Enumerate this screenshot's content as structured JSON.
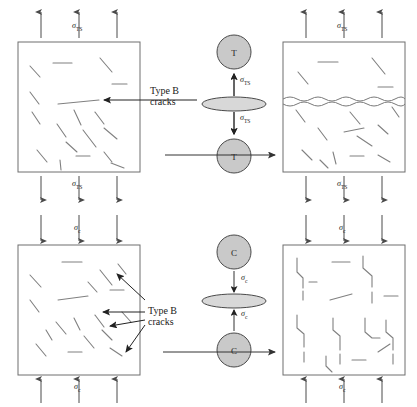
{
  "figure": {
    "background_color": "#ffffff",
    "line_color": "#6e6e6e",
    "dark_line_color": "#333333",
    "disc_fill": "#c9c9c9",
    "disc_stroke": "#4a4a4a"
  },
  "symbols": {
    "sigma": "σ",
    "tensile_sub": "TS",
    "compressive_sub": "c",
    "tensile_label": "σTS",
    "compressive_label": "σc",
    "disc_tension_letter": "T",
    "disc_compression_letter": "C"
  },
  "annotations": {
    "type_b_line1": "Type B",
    "type_b_line2": "cracks"
  },
  "panels": [
    {
      "id": "top-left",
      "name": "tensile-before-specimen",
      "row": "tension",
      "stage": "before",
      "load_label": "σTS",
      "load_direction": "outward",
      "arrow_count_top": 3,
      "arrow_count_bottom": 3,
      "crack_type": "random-microcracks",
      "crack_count": 18,
      "box": {
        "x": 18,
        "y": 42,
        "w": 122,
        "h": 130
      }
    },
    {
      "id": "top-right",
      "name": "tensile-after-specimen",
      "row": "tension",
      "stage": "after",
      "load_label": "σTS",
      "load_direction": "outward",
      "arrow_count_top": 3,
      "arrow_count_bottom": 3,
      "crack_type": "horizontal-wavy-fracture",
      "crack_count": 16,
      "box": {
        "x": 283,
        "y": 42,
        "w": 122,
        "h": 130
      }
    },
    {
      "id": "bottom-left",
      "name": "compressive-before-specimen",
      "row": "compression",
      "stage": "before",
      "load_label": "σc",
      "load_direction": "inward",
      "arrow_count_top": 3,
      "arrow_count_bottom": 3,
      "crack_type": "random-microcracks",
      "crack_count": 18,
      "box": {
        "x": 18,
        "y": 245,
        "w": 122,
        "h": 130
      }
    },
    {
      "id": "bottom-right",
      "name": "compressive-after-specimen",
      "row": "compression",
      "stage": "after",
      "load_label": "σc",
      "load_direction": "inward",
      "arrow_count_top": 3,
      "arrow_count_bottom": 3,
      "crack_type": "vertical-stepped-splitting",
      "crack_count": 14,
      "box": {
        "x": 283,
        "y": 245,
        "w": 122,
        "h": 130
      }
    }
  ],
  "center_assemblies": [
    {
      "id": "tension-disc",
      "row": "tension",
      "top_circle_letter": "T",
      "bottom_circle_letter": "C_none",
      "bottom_letter": "T",
      "upper_stress_label": "σTS",
      "lower_stress_label": "σTS",
      "arrow_direction": "away-from-disc",
      "disc_center": {
        "x": 234,
        "y": 104
      }
    },
    {
      "id": "compression-disc",
      "row": "compression",
      "top_circle_letter": "C",
      "bottom_letter": "C",
      "upper_stress_label": "σc",
      "lower_stress_label": "σc",
      "arrow_direction": "toward-disc",
      "disc_center": {
        "x": 234,
        "y": 301
      }
    }
  ],
  "flow_arrows": [
    {
      "id": "tension-flow",
      "from_panel": "top-left",
      "to_panel": "top-right",
      "direction": "right",
      "y": 155
    },
    {
      "id": "compression-flow",
      "from_panel": "bottom-left",
      "to_panel": "bottom-right",
      "direction": "right",
      "y": 352
    }
  ],
  "callouts": [
    {
      "id": "top-callout",
      "label_line1": "Type B",
      "label_line2": "cracks",
      "label_x": 150,
      "label_y": 88,
      "target_panel": "top-left",
      "leader_count": 1
    },
    {
      "id": "bottom-callout",
      "label_line1": "Type B",
      "label_line2": "cracks",
      "label_x": 148,
      "label_y": 308,
      "target_panel": "bottom-left",
      "leader_count": 4
    }
  ]
}
